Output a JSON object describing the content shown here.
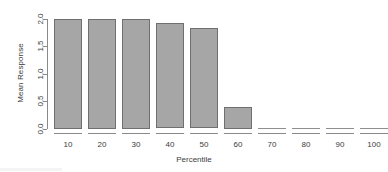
{
  "chart_data": {
    "type": "bar",
    "title": "",
    "subtitle": "",
    "xlabel": "Percentile",
    "ylabel": "Mean Response",
    "categories": [
      "10",
      "20",
      "30",
      "40",
      "50",
      "60",
      "70",
      "80",
      "90",
      "100"
    ],
    "values": [
      2.0,
      2.0,
      2.0,
      1.92,
      1.82,
      0.4,
      0.0,
      0.0,
      0.0,
      0.0
    ],
    "ylim": [
      0.0,
      2.0
    ],
    "ytick_labels": [
      "0.0",
      "0.5",
      "1.0",
      "1.5",
      "2.0"
    ],
    "ytick_values": [
      0.0,
      0.5,
      1.0,
      1.5,
      2.0
    ],
    "grid": false,
    "legend": null,
    "bar_fill_color": "#a6a6a6",
    "bar_border_color": "#6f6f6f",
    "axis_color": "#8a8a8a",
    "text_color": "#3d3d3d",
    "background_color": "#ffffff"
  }
}
